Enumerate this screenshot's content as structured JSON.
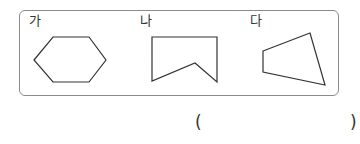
{
  "figures": [
    {
      "label": "가",
      "shape": "hexagon"
    },
    {
      "label": "나",
      "shape": "concave-pentagon"
    },
    {
      "label": "다",
      "shape": "quadrilateral"
    }
  ],
  "answer": {
    "open": "(",
    "close": ")",
    "value": ""
  },
  "colors": {
    "frame": "#8a8a8a",
    "stroke": "#333333"
  }
}
